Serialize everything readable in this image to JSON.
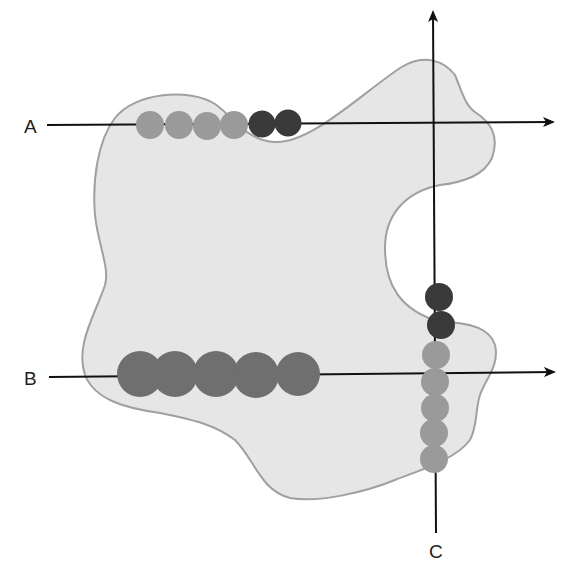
{
  "diagram": {
    "labels": {
      "a": "A",
      "b": "B",
      "c": "C"
    },
    "colors": {
      "region_fill": "#e6e6e6",
      "region_stroke": "#a0a0a0",
      "axis": "#111111",
      "light_bead": "#9a9a9a",
      "mid_bead": "#6f6f6f",
      "dark_bead": "#3a3a3a"
    },
    "lines": [
      {
        "id": "A",
        "orientation": "horizontal",
        "beads": [
          {
            "shade": "light",
            "count": 4
          },
          {
            "shade": "dark",
            "count": 2
          }
        ]
      },
      {
        "id": "B",
        "orientation": "horizontal",
        "beads": [
          {
            "shade": "mid",
            "count": 5
          }
        ]
      },
      {
        "id": "C",
        "orientation": "vertical",
        "beads": [
          {
            "shade": "dark",
            "count": 2
          },
          {
            "shade": "light",
            "count": 5
          }
        ]
      }
    ]
  }
}
